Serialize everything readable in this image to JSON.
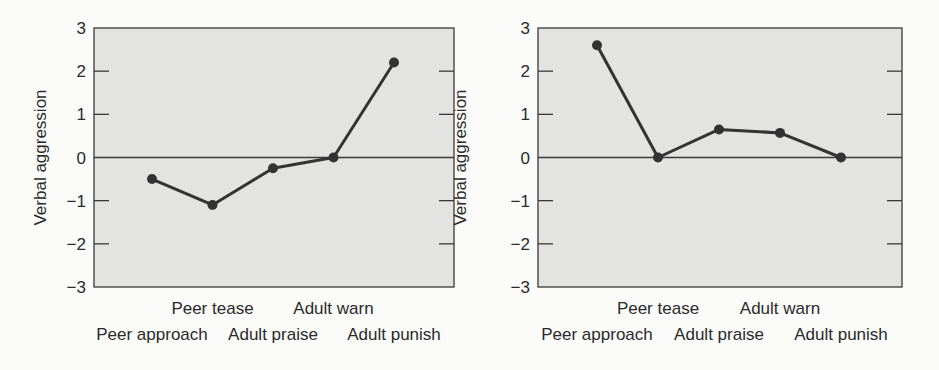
{
  "chart_data": [
    {
      "type": "line",
      "title": "",
      "xlabel": "",
      "ylabel": "Verbal aggression",
      "ylim": [
        -3,
        3
      ],
      "yticks": [
        3,
        2,
        1,
        0,
        -1,
        -2,
        -3
      ],
      "ytick_labels": [
        "3",
        "2",
        "1",
        "0",
        "−1",
        "−2",
        "−3"
      ],
      "categories": [
        "Peer approach",
        "Peer tease",
        "Adult praise",
        "Adult warn",
        "Adult punish"
      ],
      "values": [
        -0.5,
        -1.1,
        -0.25,
        0.0,
        2.2
      ],
      "grid": false,
      "zero_line": true,
      "legend": null
    },
    {
      "type": "line",
      "title": "",
      "xlabel": "",
      "ylabel": "Verbal aggression",
      "ylim": [
        -3,
        3
      ],
      "yticks": [
        3,
        2,
        1,
        0,
        -1,
        -2,
        -3
      ],
      "ytick_labels": [
        "3",
        "2",
        "1",
        "0",
        "−1",
        "−2",
        "−3"
      ],
      "categories": [
        "Peer approach",
        "Peer tease",
        "Adult praise",
        "Adult warn",
        "Adult punish"
      ],
      "values": [
        2.6,
        0.0,
        0.65,
        0.57,
        0.0
      ],
      "grid": false,
      "zero_line": true,
      "legend": null
    }
  ],
  "style": {
    "plot_bg": "#e3e3e1",
    "line_color": "#333333",
    "frame_color": "#3a3a3a"
  }
}
